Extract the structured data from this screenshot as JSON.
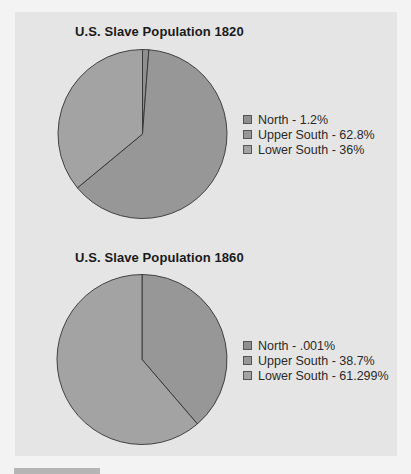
{
  "colors": {
    "north": "#8f8f8f",
    "upper_south": "#979797",
    "lower_south": "#a3a3a3",
    "outline": "#333333",
    "panel": "#e5e5e5"
  },
  "charts": [
    {
      "title": "U.S. Slave Population 1820",
      "legend": [
        {
          "label": "North - 1.2%"
        },
        {
          "label": "Upper South - 62.8%"
        },
        {
          "label": "Lower South - 36%"
        }
      ]
    },
    {
      "title": "U.S. Slave Population 1860",
      "legend": [
        {
          "label": "North - .001%"
        },
        {
          "label": "Upper South - 38.7%"
        },
        {
          "label": "Lower South - 61.299%"
        }
      ]
    }
  ],
  "chart_data": [
    {
      "type": "pie",
      "title": "U.S. Slave Population 1820",
      "categories": [
        "North",
        "Upper South",
        "Lower South"
      ],
      "values": [
        1.2,
        62.8,
        36
      ],
      "unit": "%",
      "legend_position": "right",
      "start_angle": "12 o'clock, clockwise"
    },
    {
      "type": "pie",
      "title": "U.S. Slave Population 1860",
      "categories": [
        "North",
        "Upper South",
        "Lower South"
      ],
      "values": [
        0.001,
        38.7,
        61.299
      ],
      "unit": "%",
      "legend_position": "right",
      "start_angle": "12 o'clock, clockwise"
    }
  ]
}
